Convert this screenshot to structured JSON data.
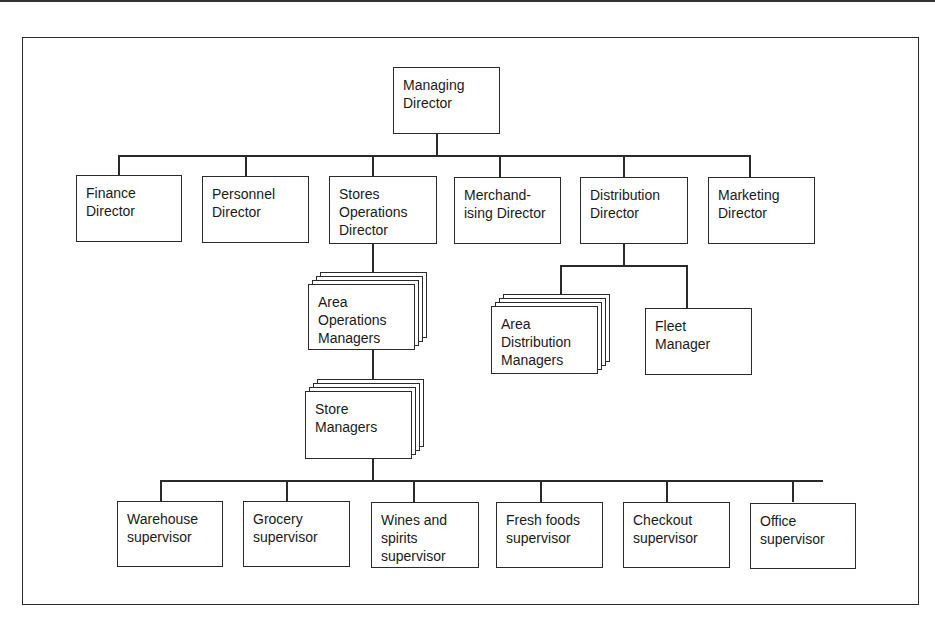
{
  "chart": {
    "managing_director": "Managing\nDirector",
    "directors": [
      "Finance\nDirector",
      "Personnel\nDirector",
      "Stores\nOperations\nDirector",
      "Merchand-\nising Director",
      "Distribution\nDirector",
      "Marketing\nDirector"
    ],
    "area_operations_managers": "Area\nOperations\nManagers",
    "store_managers": "Store\nManagers",
    "area_distribution_managers": "Area\nDistribution\nManagers",
    "fleet_manager": "Fleet\nManager",
    "supervisors": [
      "Warehouse\nsupervisor",
      "Grocery\nsupervisor",
      "Wines and\nspirits\nsupervisor",
      "Fresh foods\nsupervisor",
      "Checkout\nsupervisor",
      "Office\nsupervisor"
    ]
  }
}
